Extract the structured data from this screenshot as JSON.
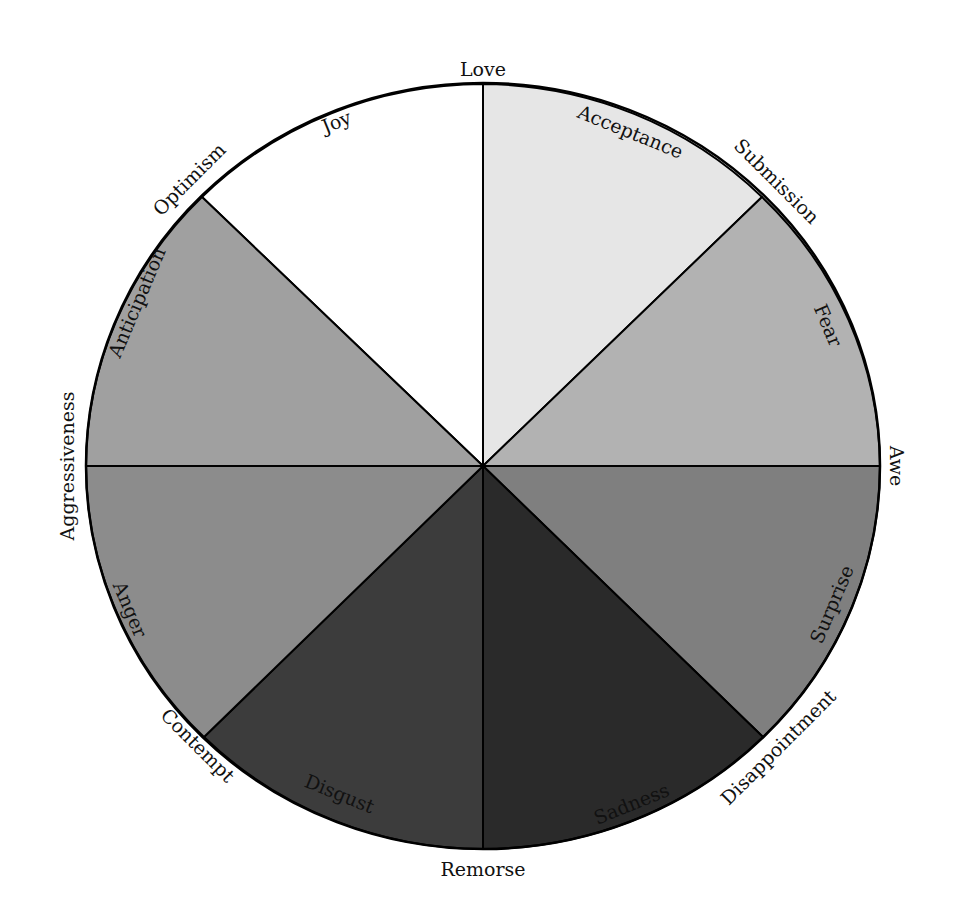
{
  "diagram": {
    "type": "emotion-wheel",
    "center": [
      483,
      466
    ],
    "radius_x": 397,
    "radius_y": 383,
    "stroke_color": "#000000",
    "sectors": [
      {
        "name": "Joy",
        "color": "#ffffff",
        "start_deg": -45,
        "end_deg": 0
      },
      {
        "name": "Acceptance",
        "color": "#e6e6e6",
        "start_deg": 0,
        "end_deg": 45
      },
      {
        "name": "Fear",
        "color": "#b2b2b2",
        "start_deg": 45,
        "end_deg": 90
      },
      {
        "name": "Surprise",
        "color": "#7f7f7f",
        "start_deg": 90,
        "end_deg": 135
      },
      {
        "name": "Sadness",
        "color": "#2a2a2a",
        "start_deg": 135,
        "end_deg": 180
      },
      {
        "name": "Disgust",
        "color": "#3c3c3c",
        "start_deg": 180,
        "end_deg": 225
      },
      {
        "name": "Anger",
        "color": "#8c8c8c",
        "start_deg": 225,
        "end_deg": 270
      },
      {
        "name": "Anticipation",
        "color": "#a0a0a0",
        "start_deg": 270,
        "end_deg": 315
      }
    ],
    "inner_labels": {
      "joy": "Joy",
      "acceptance": "Acceptance",
      "fear": "Fear",
      "surprise": "Surprise",
      "sadness": "Sadness",
      "disgust": "Disgust",
      "anger": "Anger",
      "anticipation": "Anticipation"
    },
    "outer_labels": {
      "love": "Love",
      "submission": "Submission",
      "awe": "Awe",
      "disappointment": "Disappointment",
      "remorse": "Remorse",
      "contempt": "Contempt",
      "aggressiveness": "Aggressiveness",
      "optimism": "Optimism"
    }
  }
}
